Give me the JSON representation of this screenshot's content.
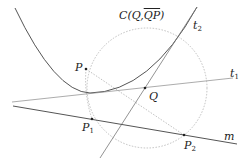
{
  "diagram": {
    "title_label": {
      "prefix": "C(Q,",
      "overline": "QP",
      "suffix": ")"
    },
    "points": {
      "P": {
        "label": "P",
        "x": 86,
        "y": 69
      },
      "Q": {
        "label": "Q",
        "x": 145,
        "y": 88
      },
      "P1": {
        "label": "P",
        "sub": "1",
        "x": 92,
        "y": 119
      },
      "P2": {
        "label": "P",
        "sub": "2",
        "x": 184,
        "y": 135
      }
    },
    "lines": {
      "m": {
        "label": "m"
      },
      "t1": {
        "label": "t",
        "sub": "1"
      },
      "t2": {
        "label": "t",
        "sub": "2"
      }
    },
    "colors": {
      "curve": "#555555",
      "line": "#666666",
      "dashed": "#aaaaaa",
      "point": "#222222"
    }
  }
}
